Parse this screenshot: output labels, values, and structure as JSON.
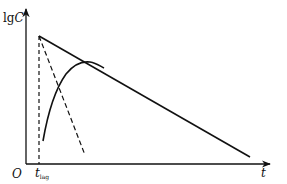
{
  "diagram": {
    "title": "",
    "y_axis": {
      "label_prefix": "lg",
      "label_var": "C"
    },
    "x_axis": {
      "label": "t"
    },
    "origin_label": "O",
    "tick_label": {
      "main": "t",
      "sub": "lag"
    },
    "elements": [
      {
        "name": "elimination-line",
        "style": "solid",
        "from": [
          39,
          36
        ],
        "to": [
          250,
          157
        ]
      },
      {
        "name": "absorption-residual-line",
        "style": "dashed",
        "from": [
          39,
          36
        ],
        "to": [
          85,
          155
        ]
      },
      {
        "name": "lag-time-marker",
        "style": "dashed",
        "from": [
          39,
          36
        ],
        "to": [
          39,
          164
        ]
      },
      {
        "name": "concentration-curve",
        "style": "solid",
        "description": "rises from near t_lag, peaks and merges tangentially into elimination line"
      }
    ],
    "colors": {
      "line": "#111111",
      "background": "#ffffff"
    }
  }
}
